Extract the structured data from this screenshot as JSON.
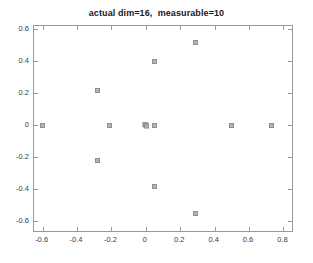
{
  "chart_data": {
    "type": "scatter",
    "title": "actual dim=16,  measurable=10",
    "xlabel": "",
    "ylabel": "",
    "xlim": [
      -0.65,
      0.85
    ],
    "ylim": [
      -0.66,
      0.62
    ],
    "grid": false,
    "legend": null,
    "marker": "square-outline",
    "marker_color": "#b4b4b4",
    "n_points_total": 16,
    "n_distinct_positions": 10,
    "xticks": [
      -0.6,
      -0.4,
      -0.2,
      0,
      0.2,
      0.4,
      0.6,
      0.8
    ],
    "xtick_labels": [
      "-0.6",
      "-0.4",
      "-0.2",
      "0",
      "0.2",
      "0.4",
      "0.6",
      "0.8"
    ],
    "yticks": [
      -0.6,
      -0.4,
      -0.2,
      0,
      0.2,
      0.4,
      0.6
    ],
    "ytick_labels": [
      "-0.6",
      "-0.4",
      "-0.2",
      "0",
      "0.2",
      "0.4",
      "0.6"
    ],
    "points": [
      {
        "x": 0.29,
        "y": 0.52,
        "count": 1
      },
      {
        "x": 0.05,
        "y": 0.4,
        "count": 1
      },
      {
        "x": -0.28,
        "y": 0.22,
        "count": 1
      },
      {
        "x": -0.6,
        "y": 0.0,
        "count": 1
      },
      {
        "x": -0.21,
        "y": 0.0,
        "count": 1
      },
      {
        "x": 0.0,
        "y": 0.0,
        "count": 7
      },
      {
        "x": 0.05,
        "y": 0.0,
        "count": 1
      },
      {
        "x": 0.5,
        "y": 0.0,
        "count": 1
      },
      {
        "x": 0.73,
        "y": 0.0,
        "count": 1
      },
      {
        "x": -0.28,
        "y": -0.22,
        "count": 1
      },
      {
        "x": 0.05,
        "y": -0.38,
        "count": 1
      },
      {
        "x": 0.29,
        "y": -0.55,
        "count": 1
      }
    ]
  }
}
